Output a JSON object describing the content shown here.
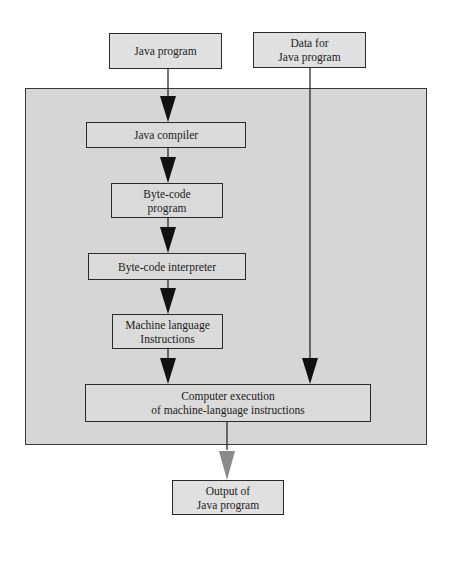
{
  "diagram": {
    "title": "",
    "inputs": {
      "java_program": {
        "line1": "Java program"
      },
      "data_for_program": {
        "line1": "Data for",
        "line2": "Java program"
      }
    },
    "steps": [
      {
        "line1": "Java compiler"
      },
      {
        "line1": "Byte-code",
        "line2": "program"
      },
      {
        "line1": "Byte-code interpreter"
      },
      {
        "line1": "Machine language",
        "line2": "Instructions"
      },
      {
        "line1": "Computer execution",
        "line2": "of machine-language instructions"
      }
    ],
    "output": {
      "line1": "Output of",
      "line2": "Java program"
    },
    "colors": {
      "background": "#ffffff",
      "panel_fill": "#d6d6d6",
      "box_fill": "#dadada",
      "stroke": "#2a2a2a",
      "arrow": "#111111",
      "output_arrow": "#8a8a8a"
    }
  }
}
